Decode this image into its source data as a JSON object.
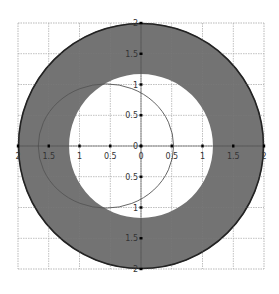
{
  "chart_data": {
    "type": "area",
    "title": "",
    "xlabel": "",
    "ylabel": "",
    "xlim": [
      -2,
      2
    ],
    "ylim": [
      -2,
      2
    ],
    "grid": true,
    "legend": null,
    "x_ticks": [
      -2,
      -1.5,
      -1,
      -0.5,
      0,
      0.5,
      1,
      1.5,
      2
    ],
    "y_ticks": [
      -2,
      -1.5,
      -1,
      -0.5,
      0,
      0.5,
      1,
      1.5,
      2
    ],
    "x_tick_labels": [
      "2",
      "1.5",
      "1",
      "0.5",
      "0",
      "0.5",
      "1",
      "1.5",
      "2"
    ],
    "y_tick_labels": [
      "2",
      "1.5",
      "1",
      "0.5",
      "0",
      "0.5",
      "1",
      "1.5",
      "2"
    ],
    "shapes": [
      {
        "name": "shaded annulus",
        "kind": "ring",
        "center": [
          0,
          0
        ],
        "outer_radius": 2.0,
        "inner_radius": 1.17,
        "fill": "#6b6b6b",
        "edge": "#222222"
      },
      {
        "name": "thin circle",
        "kind": "ellipse",
        "center": [
          -0.57,
          0
        ],
        "rx": 1.1,
        "ry": 1.01,
        "stroke": "#555555"
      }
    ]
  },
  "colors": {
    "background": "#ffffff",
    "grid": "#c8c8c8",
    "ring_fill": "#6b6b6b",
    "ring_edge": "#1e1e1e",
    "thin_circle": "#555555",
    "axis": "#000000"
  },
  "layout": {
    "cx": 141,
    "cy": 146,
    "unit": 61.5
  }
}
